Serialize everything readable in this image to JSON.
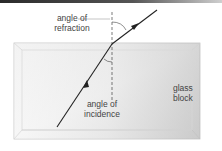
{
  "diagram": {
    "labels": {
      "refraction_line1": "angle of",
      "refraction_line2": "refraction",
      "incidence_line1": "angle of",
      "incidence_line2": "incidence",
      "glass_line1": "glass",
      "glass_line2": "block"
    },
    "elements": {
      "glass_block": "rectangular glass block (3D bevelled)",
      "normal_line": "dashed vertical normal at point of incidence",
      "incident_ray": "ray travelling up through glass with arrow",
      "refracted_ray": "ray leaving top surface bending away from normal with arrow"
    },
    "colors": {
      "ray": "#222222",
      "block_edge": "#bdbdbd",
      "block_fill_light": "#f7f7f7",
      "block_fill_dark": "#c8c8c8",
      "text": "#444444",
      "top_bar": "#2a2a2a"
    }
  }
}
